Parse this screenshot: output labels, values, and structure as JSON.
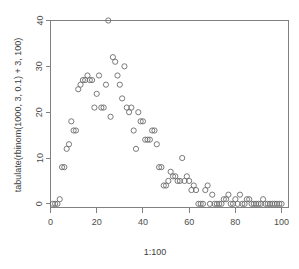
{
  "chart_data": {
    "type": "scatter",
    "title": "",
    "xlabel": "1:100",
    "ylabel": "tabulate(rbinom(1000, 3, 0.1) + 3, 100)",
    "xlim": [
      0,
      103
    ],
    "ylim": [
      -0.8,
      40
    ],
    "grid": false,
    "legend": null,
    "point_symbol": "open-circle",
    "point_color": "#6b6b6b",
    "xticks": [
      0,
      20,
      40,
      60,
      80,
      100
    ],
    "yticks": [
      0,
      10,
      20,
      30,
      40
    ],
    "xtick_labels": [
      "0",
      "20",
      "40",
      "60",
      "80",
      "100"
    ],
    "ytick_labels": [
      "0",
      "10",
      "20",
      "30",
      "40"
    ],
    "x": [
      1,
      2,
      3,
      4,
      5,
      6,
      7,
      8,
      9,
      10,
      11,
      12,
      13,
      14,
      15,
      16,
      17,
      18,
      19,
      20,
      21,
      22,
      23,
      24,
      25,
      26,
      27,
      28,
      29,
      30,
      31,
      32,
      33,
      34,
      35,
      36,
      37,
      38,
      39,
      40,
      41,
      42,
      43,
      44,
      45,
      46,
      47,
      48,
      49,
      50,
      51,
      52,
      53,
      54,
      55,
      56,
      57,
      58,
      59,
      60,
      61,
      62,
      63,
      64,
      65,
      66,
      67,
      68,
      69,
      70,
      71,
      72,
      73,
      74,
      75,
      76,
      77,
      78,
      79,
      80,
      81,
      82,
      83,
      84,
      85,
      86,
      87,
      88,
      89,
      90,
      91,
      92,
      93,
      94,
      95,
      96,
      97,
      98,
      99,
      100
    ],
    "y": [
      0,
      0,
      0,
      1,
      8,
      8,
      12,
      13,
      18,
      16,
      16,
      25,
      26,
      27,
      27,
      28,
      27,
      27,
      21,
      24,
      28,
      21,
      21,
      26,
      40,
      19,
      32,
      31,
      28,
      26,
      23,
      30,
      21,
      20,
      21,
      16,
      12,
      20,
      18,
      18,
      14,
      14,
      14,
      16,
      16,
      13,
      8,
      8,
      4,
      4,
      5,
      7,
      6,
      6,
      5,
      5,
      10,
      5,
      6,
      5,
      3,
      4,
      3,
      0,
      0,
      0,
      3,
      4,
      0,
      2,
      0,
      0,
      0,
      0,
      1,
      1,
      2,
      0,
      0,
      1,
      0,
      2,
      0,
      0,
      1,
      1,
      0,
      0,
      0,
      0,
      0,
      1,
      0,
      0,
      0,
      0,
      0,
      0,
      0,
      0
    ]
  },
  "axis": {
    "x_label": "1:100",
    "y_label": "tabulate(rbinom(1000, 3, 0.1) + 3, 100)"
  }
}
